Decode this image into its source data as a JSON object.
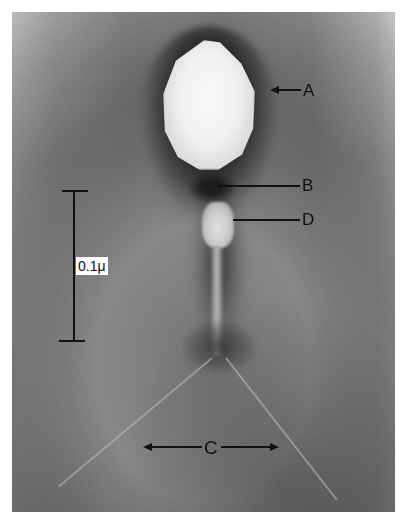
{
  "figure": {
    "labels": {
      "A": "A",
      "B": "B",
      "C": "C",
      "D": "D"
    },
    "scale_bar": {
      "label": "0.1μ"
    },
    "colors": {
      "label_ink": "#111111",
      "background": "#ffffff",
      "head_fill": "#f1f1f1",
      "stain": "#2a2a2a"
    }
  }
}
